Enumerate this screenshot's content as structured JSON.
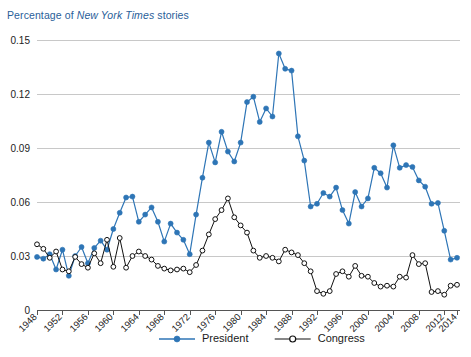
{
  "title": {
    "prefix": "Percentage of ",
    "source": "New York Times",
    "suffix": " stories",
    "full": "Percentage of New York Times stories",
    "color": "#2a6099"
  },
  "legend": {
    "position": "bottom-center",
    "entries": [
      {
        "label": "President",
        "color": "#2e75b6",
        "marker": "filled-circle"
      },
      {
        "label": "Congress",
        "color": "#111111",
        "marker": "open-circle"
      }
    ]
  },
  "chart_data": {
    "type": "line",
    "title": "Percentage of New York Times stories",
    "xlabel": "",
    "ylabel": "",
    "xlim": [
      1948,
      2014
    ],
    "ylim": [
      0,
      0.15
    ],
    "grid": true,
    "yticks": [
      0,
      0.03,
      0.06,
      0.09,
      0.12,
      0.15
    ],
    "ytick_labels": [
      "0",
      "0.03",
      "0.06",
      "0.09",
      "0.12",
      "0.15"
    ],
    "xticks": [
      1948,
      1952,
      1956,
      1960,
      1964,
      1968,
      1972,
      1976,
      1980,
      1984,
      1988,
      1992,
      1996,
      2000,
      2004,
      2008,
      2012,
      2014
    ],
    "xtick_labels": [
      "1948",
      "1952",
      "1956",
      "1960",
      "1964",
      "1968",
      "1972",
      "1976",
      "1980",
      "1984",
      "1988",
      "1992",
      "1996",
      "2000",
      "2004",
      "2008",
      "2012",
      "2014"
    ],
    "x": [
      1948,
      1949,
      1950,
      1951,
      1952,
      1953,
      1954,
      1955,
      1956,
      1957,
      1958,
      1959,
      1960,
      1961,
      1962,
      1963,
      1964,
      1965,
      1966,
      1967,
      1968,
      1969,
      1970,
      1971,
      1972,
      1973,
      1974,
      1975,
      1976,
      1977,
      1978,
      1979,
      1980,
      1981,
      1982,
      1983,
      1984,
      1985,
      1986,
      1987,
      1988,
      1989,
      1990,
      1991,
      1992,
      1993,
      1994,
      1995,
      1996,
      1997,
      1998,
      1999,
      2000,
      2001,
      2002,
      2003,
      2004,
      2005,
      2006,
      2007,
      2008,
      2009,
      2010,
      2011,
      2012,
      2013,
      2014
    ],
    "series": [
      {
        "name": "President",
        "color": "#2e75b6",
        "marker": "filled-circle",
        "values": [
          0.0295,
          0.0285,
          0.031,
          0.0225,
          0.0335,
          0.019,
          0.03,
          0.035,
          0.026,
          0.0345,
          0.0385,
          0.0335,
          0.045,
          0.054,
          0.0625,
          0.063,
          0.049,
          0.053,
          0.057,
          0.049,
          0.038,
          0.048,
          0.043,
          0.039,
          0.031,
          0.053,
          0.0735,
          0.093,
          0.082,
          0.099,
          0.088,
          0.0825,
          0.093,
          0.1155,
          0.1185,
          0.1045,
          0.112,
          0.1075,
          0.1425,
          0.134,
          0.133,
          0.0965,
          0.083,
          0.0575,
          0.059,
          0.065,
          0.063,
          0.068,
          0.0555,
          0.048,
          0.0655,
          0.0575,
          0.062,
          0.079,
          0.076,
          0.068,
          0.0915,
          0.079,
          0.0805,
          0.0795,
          0.072,
          0.0685,
          0.059,
          0.0595,
          0.044,
          0.028,
          0.029
        ],
        "annotations": [
          {
            "x": 1986,
            "y": 0.1425,
            "note": "series peak"
          }
        ]
      },
      {
        "name": "Congress",
        "color": "#111111",
        "marker": "open-circle",
        "values": [
          0.0365,
          0.034,
          0.029,
          0.0325,
          0.0225,
          0.0215,
          0.0295,
          0.0255,
          0.0235,
          0.0315,
          0.026,
          0.039,
          0.024,
          0.04,
          0.0235,
          0.03,
          0.0325,
          0.03,
          0.028,
          0.0245,
          0.023,
          0.022,
          0.0225,
          0.023,
          0.021,
          0.025,
          0.033,
          0.042,
          0.0505,
          0.0555,
          0.062,
          0.0515,
          0.047,
          0.043,
          0.033,
          0.029,
          0.03,
          0.029,
          0.027,
          0.0335,
          0.032,
          0.0305,
          0.026,
          0.0215,
          0.0105,
          0.009,
          0.0105,
          0.02,
          0.0215,
          0.0185,
          0.0245,
          0.019,
          0.0185,
          0.015,
          0.013,
          0.0135,
          0.013,
          0.0185,
          0.018,
          0.0305,
          0.0255,
          0.026,
          0.01,
          0.0105,
          0.0085,
          0.0135,
          0.014
        ],
        "annotations": [
          {
            "x": 1978,
            "y": 0.062,
            "note": "series peak"
          }
        ]
      }
    ]
  }
}
